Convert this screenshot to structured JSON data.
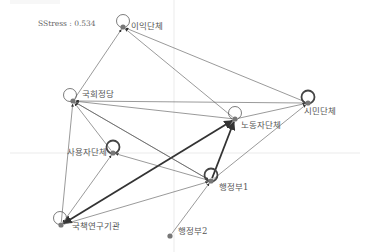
{
  "diagram": {
    "type": "network",
    "stress_label": "SStress : 0.534",
    "colors": {
      "edge": "#555555",
      "edge_thick": "#333333",
      "node": "#777777",
      "loop": "#444444",
      "grid": "#e6e6e6",
      "label": "#555555"
    },
    "grid": {
      "vertical_x": 174,
      "horizontal_y": 153
    },
    "nodes": [
      {
        "id": "interest",
        "label": "이익단체",
        "x": 123,
        "y": 27,
        "loop": "thin",
        "label_dx": 8,
        "label_dy": 2
      },
      {
        "id": "assembly",
        "label": "국회정당",
        "x": 73,
        "y": 101,
        "loop": "thin",
        "label_dx": 9,
        "label_dy": -4
      },
      {
        "id": "labor",
        "label": "노동자단체",
        "x": 235,
        "y": 119,
        "loop": "thin",
        "label_dx": 6,
        "label_dy": 9
      },
      {
        "id": "civic",
        "label": "시민단체",
        "x": 308,
        "y": 103,
        "loop": "thick",
        "label_dx": -4,
        "label_dy": 11
      },
      {
        "id": "employer",
        "label": "사용자단체",
        "x": 113,
        "y": 153,
        "loop": "thick",
        "label_dx": -46,
        "label_dy": 2
      },
      {
        "id": "admin1",
        "label": "행정부1",
        "x": 211,
        "y": 181,
        "loop": "thick",
        "label_dx": 8,
        "label_dy": 9
      },
      {
        "id": "research",
        "label": "국책연구기관",
        "x": 61,
        "y": 225,
        "loop": "thin",
        "label_dx": 11,
        "label_dy": 4
      },
      {
        "id": "admin2",
        "label": "행정부2",
        "x": 170,
        "y": 236,
        "loop": "none",
        "label_dx": 8,
        "label_dy": -2
      }
    ],
    "edges": [
      {
        "from": "assembly",
        "to": "interest",
        "weight": 1,
        "bidirectional": false
      },
      {
        "from": "civic",
        "to": "interest",
        "weight": 1,
        "bidirectional": false
      },
      {
        "from": "labor",
        "to": "interest",
        "weight": 1,
        "bidirectional": false
      },
      {
        "from": "civic",
        "to": "assembly",
        "weight": 1,
        "bidirectional": false
      },
      {
        "from": "labor",
        "to": "assembly",
        "weight": 1,
        "bidirectional": false
      },
      {
        "from": "employer",
        "to": "assembly",
        "weight": 1,
        "bidirectional": false
      },
      {
        "from": "admin1",
        "to": "assembly",
        "weight": 1,
        "bidirectional": false
      },
      {
        "from": "research",
        "to": "assembly",
        "weight": 1,
        "bidirectional": false
      },
      {
        "from": "labor",
        "to": "civic",
        "weight": 1,
        "bidirectional": false
      },
      {
        "from": "admin1",
        "to": "civic",
        "weight": 1,
        "bidirectional": false
      },
      {
        "from": "admin1",
        "to": "labor",
        "weight": 2,
        "bidirectional": false
      },
      {
        "from": "research",
        "to": "labor",
        "weight": 2,
        "bidirectional": true
      },
      {
        "from": "admin1",
        "to": "employer",
        "weight": 1,
        "bidirectional": false
      },
      {
        "from": "research",
        "to": "employer",
        "weight": 1,
        "bidirectional": true
      },
      {
        "from": "assembly",
        "to": "admin1",
        "weight": 1,
        "bidirectional": false
      },
      {
        "from": "research",
        "to": "admin1",
        "weight": 1,
        "bidirectional": false
      },
      {
        "from": "admin2",
        "to": "admin1",
        "weight": 1,
        "bidirectional": false
      }
    ]
  }
}
